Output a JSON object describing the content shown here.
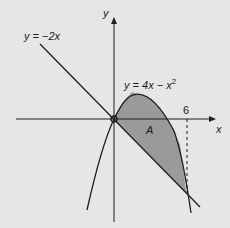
{
  "diagram": {
    "axes": {
      "x_label": "x",
      "y_label": "y",
      "tick_label_6": "6"
    },
    "curves": {
      "line_label": "y = −2x",
      "parabola_label_main": "y = 4x − x",
      "parabola_label_exp": "2"
    },
    "region_label": "A",
    "colors": {
      "background": "#e6e6e6",
      "shaded_region": "#9a9a9a",
      "stroke": "#1f1f1f"
    }
  }
}
